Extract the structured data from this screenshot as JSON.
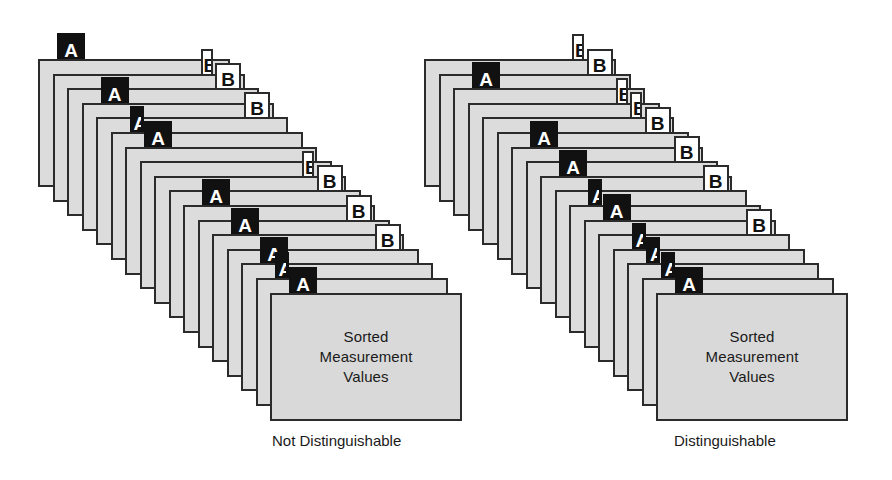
{
  "figure": {
    "title": "",
    "background_color": "#ffffff",
    "card_fill_color": "#dcdcdc",
    "card_border_color": "#2b2b2b",
    "tab_a_color": "#111111",
    "tab_a_text_color": "#ffffff",
    "tab_b_color": "#ffffff",
    "tab_b_text_color": "#111111",
    "front_card_lines": [
      "Sorted",
      "Measurement",
      "Values"
    ],
    "label_a": "A",
    "label_b": "B"
  },
  "stacks": [
    {
      "id": "not-distinguishable",
      "caption": "Not Distinguishable",
      "caption_x": 272,
      "caption_y": 432,
      "card_count": 17,
      "origin_x": 38,
      "origin_y": 59,
      "step_x": 14.5,
      "step_y": 14.6,
      "cards": [
        {
          "index": 0,
          "tab": "A",
          "tab_side": "left",
          "tab_offset": 20,
          "tab_style": "full"
        },
        {
          "index": 1,
          "tab": "B",
          "tab_side": "right",
          "tab_offset": 148,
          "tab_style": "sliver"
        },
        {
          "index": 2,
          "tab": "B",
          "tab_side": "right",
          "tab_offset": 148,
          "tab_style": "full"
        },
        {
          "index": 3,
          "tab": "A",
          "tab_side": "left",
          "tab_offset": 20,
          "tab_style": "full"
        },
        {
          "index": 4,
          "tab": "B",
          "tab_side": "right",
          "tab_offset": 148,
          "tab_style": "full"
        },
        {
          "index": 5,
          "tab": "A",
          "tab_side": "left",
          "tab_offset": 20,
          "tab_style": "sliver"
        },
        {
          "index": 6,
          "tab": "A",
          "tab_side": "left",
          "tab_offset": 20,
          "tab_style": "full"
        },
        {
          "index": 7,
          "tab": "none",
          "tab_side": "left",
          "tab_offset": 0,
          "tab_style": "none"
        },
        {
          "index": 8,
          "tab": "B",
          "tab_side": "right",
          "tab_offset": 148,
          "tab_style": "sliver"
        },
        {
          "index": 9,
          "tab": "B",
          "tab_side": "right",
          "tab_offset": 148,
          "tab_style": "full"
        },
        {
          "index": 10,
          "tab": "A",
          "tab_side": "left",
          "tab_offset": 20,
          "tab_style": "full"
        },
        {
          "index": 11,
          "tab": "B",
          "tab_side": "right",
          "tab_offset": 148,
          "tab_style": "full"
        },
        {
          "index": 12,
          "tab": "A",
          "tab_side": "left",
          "tab_offset": 20,
          "tab_style": "full"
        },
        {
          "index": 13,
          "tab": "B",
          "tab_side": "right",
          "tab_offset": 148,
          "tab_style": "full"
        },
        {
          "index": 14,
          "tab": "A",
          "tab_side": "left",
          "tab_offset": 20,
          "tab_style": "full"
        },
        {
          "index": 15,
          "tab": "A",
          "tab_side": "left",
          "tab_offset": 20,
          "tab_style": "sliver"
        },
        {
          "index": 16,
          "tab": "A",
          "tab_side": "left",
          "tab_offset": 20,
          "tab_style": "full"
        }
      ]
    },
    {
      "id": "distinguishable",
      "caption": "Distinguishable",
      "caption_x": 266,
      "caption_y": 432,
      "card_count": 17,
      "origin_x": 16,
      "origin_y": 59,
      "step_x": 14.5,
      "step_y": 14.6,
      "cards": [
        {
          "index": 0,
          "tab": "B",
          "tab_side": "right",
          "tab_offset": 148,
          "tab_style": "sliver"
        },
        {
          "index": 1,
          "tab": "B",
          "tab_side": "right",
          "tab_offset": 148,
          "tab_style": "full"
        },
        {
          "index": 2,
          "tab": "A",
          "tab_side": "left",
          "tab_offset": 20,
          "tab_style": "full"
        },
        {
          "index": 3,
          "tab": "B",
          "tab_side": "right",
          "tab_offset": 148,
          "tab_style": "sliver"
        },
        {
          "index": 4,
          "tab": "B",
          "tab_side": "right",
          "tab_offset": 148,
          "tab_style": "sliver"
        },
        {
          "index": 5,
          "tab": "B",
          "tab_side": "right",
          "tab_offset": 148,
          "tab_style": "full"
        },
        {
          "index": 6,
          "tab": "A",
          "tab_side": "left",
          "tab_offset": 20,
          "tab_style": "full"
        },
        {
          "index": 7,
          "tab": "B",
          "tab_side": "right",
          "tab_offset": 148,
          "tab_style": "full"
        },
        {
          "index": 8,
          "tab": "A",
          "tab_side": "left",
          "tab_offset": 20,
          "tab_style": "full"
        },
        {
          "index": 9,
          "tab": "B",
          "tab_side": "right",
          "tab_offset": 148,
          "tab_style": "full"
        },
        {
          "index": 10,
          "tab": "A",
          "tab_side": "left",
          "tab_offset": 20,
          "tab_style": "sliver"
        },
        {
          "index": 11,
          "tab": "A",
          "tab_side": "left",
          "tab_offset": 20,
          "tab_style": "full"
        },
        {
          "index": 12,
          "tab": "B",
          "tab_side": "right",
          "tab_offset": 148,
          "tab_style": "full"
        },
        {
          "index": 13,
          "tab": "A",
          "tab_side": "left",
          "tab_offset": 20,
          "tab_style": "sliver"
        },
        {
          "index": 14,
          "tab": "A",
          "tab_side": "left",
          "tab_offset": 20,
          "tab_style": "sliver"
        },
        {
          "index": 15,
          "tab": "A",
          "tab_side": "left",
          "tab_offset": 20,
          "tab_style": "sliver"
        },
        {
          "index": 16,
          "tab": "A",
          "tab_side": "left",
          "tab_offset": 20,
          "tab_style": "full"
        }
      ]
    }
  ]
}
